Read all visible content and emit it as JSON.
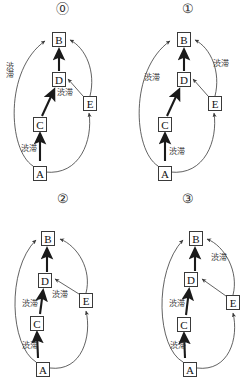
{
  "figure": {
    "kind": "causal-graph-grid",
    "rows": 2,
    "cols": 2,
    "node_labels": [
      "A",
      "B",
      "C",
      "D",
      "E"
    ],
    "edge_label_text": "渋滞",
    "stroke_color": "#3a3a3a",
    "bold_stroke_color": "#1a1a1a",
    "background": "#ffffff"
  },
  "panels": [
    {
      "id": "panel-0",
      "number": "⓪",
      "nodes": [
        {
          "name": "B",
          "label": "B",
          "x": 52,
          "y": 32
        },
        {
          "name": "D",
          "label": "D",
          "x": 52,
          "y": 72
        },
        {
          "name": "E",
          "label": "E",
          "x": 83,
          "y": 96
        },
        {
          "name": "C",
          "label": "C",
          "x": 33,
          "y": 117
        },
        {
          "name": "A",
          "label": "A",
          "x": 33,
          "y": 166
        }
      ],
      "edges": [
        {
          "from": "A",
          "to": "B",
          "style": "arc-left",
          "weight": "thin"
        },
        {
          "from": "A",
          "to": "C",
          "style": "straight",
          "weight": "bold"
        },
        {
          "from": "A",
          "to": "E",
          "style": "arc-right",
          "weight": "thin"
        },
        {
          "from": "C",
          "to": "D",
          "style": "straight",
          "weight": "bold"
        },
        {
          "from": "D",
          "to": "B",
          "style": "straight",
          "weight": "bold"
        },
        {
          "from": "E",
          "to": "D",
          "style": "straight",
          "weight": "thin"
        },
        {
          "from": "E",
          "to": "B",
          "style": "arc-right",
          "weight": "thin"
        }
      ],
      "labels": [
        {
          "name": "label-ab",
          "text": "渋滞",
          "x": 4,
          "y": 66,
          "orient": "vertical"
        },
        {
          "name": "label-ed",
          "text": "渋滞",
          "x": 57,
          "y": 89,
          "orient": "horizontal"
        },
        {
          "name": "label-ac",
          "text": "渋滞",
          "x": 21,
          "y": 143,
          "orient": "horizontal"
        }
      ]
    },
    {
      "id": "panel-1",
      "number": "①",
      "nodes": [
        {
          "name": "B",
          "label": "B",
          "x": 52,
          "y": 32
        },
        {
          "name": "D",
          "label": "D",
          "x": 52,
          "y": 72
        },
        {
          "name": "E",
          "label": "E",
          "x": 83,
          "y": 96
        },
        {
          "name": "C",
          "label": "C",
          "x": 33,
          "y": 117
        },
        {
          "name": "A",
          "label": "A",
          "x": 33,
          "y": 166
        }
      ],
      "edges": [
        {
          "from": "A",
          "to": "B",
          "style": "arc-left",
          "weight": "thin"
        },
        {
          "from": "A",
          "to": "C",
          "style": "straight",
          "weight": "bold"
        },
        {
          "from": "A",
          "to": "E",
          "style": "arc-right",
          "weight": "thin"
        },
        {
          "from": "C",
          "to": "D",
          "style": "straight",
          "weight": "bold"
        },
        {
          "from": "D",
          "to": "B",
          "style": "straight",
          "weight": "bold"
        },
        {
          "from": "E",
          "to": "D",
          "style": "straight",
          "weight": "thin"
        },
        {
          "from": "E",
          "to": "B",
          "style": "arc-right",
          "weight": "thin"
        }
      ],
      "labels": [
        {
          "name": "label-eb",
          "text": "渋滞",
          "x": 88,
          "y": 60,
          "orient": "horizontal"
        },
        {
          "name": "label-ab",
          "text": "渋滞",
          "x": 22,
          "y": 74,
          "orient": "horizontal"
        },
        {
          "name": "label-ac",
          "text": "渋滞",
          "x": 48,
          "y": 148,
          "orient": "horizontal"
        }
      ]
    },
    {
      "id": "panel-2",
      "number": "②",
      "nodes": [
        {
          "name": "B",
          "label": "B",
          "x": 41,
          "y": 41
        },
        {
          "name": "D",
          "label": "D",
          "x": 38,
          "y": 83
        },
        {
          "name": "E",
          "label": "E",
          "x": 79,
          "y": 103
        },
        {
          "name": "C",
          "label": "C",
          "x": 30,
          "y": 126
        },
        {
          "name": "A",
          "label": "A",
          "x": 36,
          "y": 172
        }
      ],
      "edges": [
        {
          "from": "A",
          "to": "B",
          "style": "arc-left",
          "weight": "thin"
        },
        {
          "from": "A",
          "to": "C",
          "style": "straight",
          "weight": "bold"
        },
        {
          "from": "A",
          "to": "E",
          "style": "arc-right",
          "weight": "thin"
        },
        {
          "from": "C",
          "to": "D",
          "style": "straight",
          "weight": "bold"
        },
        {
          "from": "D",
          "to": "B",
          "style": "straight",
          "weight": "bold"
        },
        {
          "from": "E",
          "to": "D",
          "style": "straight",
          "weight": "thin"
        },
        {
          "from": "E",
          "to": "B",
          "style": "arc-right",
          "weight": "thin"
        }
      ],
      "labels": [
        {
          "name": "label-ed",
          "text": "渋滞",
          "x": 52,
          "y": 101,
          "orient": "horizontal"
        },
        {
          "name": "label-cd",
          "text": "渋滞",
          "x": 23,
          "y": 108,
          "orient": "horizontal"
        },
        {
          "name": "label-ac",
          "text": "渋滞",
          "x": 22,
          "y": 150,
          "orient": "horizontal"
        }
      ]
    },
    {
      "id": "panel-3",
      "number": "③",
      "nodes": [
        {
          "name": "B",
          "label": "B",
          "x": 64,
          "y": 41
        },
        {
          "name": "D",
          "label": "D",
          "x": 59,
          "y": 82
        },
        {
          "name": "E",
          "label": "E",
          "x": 101,
          "y": 105
        },
        {
          "name": "C",
          "label": "C",
          "x": 52,
          "y": 127
        },
        {
          "name": "A",
          "label": "A",
          "x": 58,
          "y": 172
        }
      ],
      "edges": [
        {
          "from": "A",
          "to": "B",
          "style": "arc-left",
          "weight": "thin"
        },
        {
          "from": "A",
          "to": "C",
          "style": "straight",
          "weight": "bold"
        },
        {
          "from": "A",
          "to": "E",
          "style": "arc-right",
          "weight": "thin"
        },
        {
          "from": "C",
          "to": "D",
          "style": "straight",
          "weight": "bold"
        },
        {
          "from": "D",
          "to": "B",
          "style": "straight",
          "weight": "bold"
        },
        {
          "from": "E",
          "to": "D",
          "style": "straight",
          "weight": "thin"
        },
        {
          "from": "E",
          "to": "B",
          "style": "arc-right",
          "weight": "thin"
        }
      ],
      "labels": [
        {
          "name": "label-eb",
          "text": "渋滞",
          "x": 88,
          "y": 64,
          "orient": "horizontal"
        },
        {
          "name": "label-cd",
          "text": "渋滞",
          "x": 45,
          "y": 108,
          "orient": "horizontal"
        },
        {
          "name": "label-ac",
          "text": "渋滞",
          "x": 46,
          "y": 152,
          "orient": "horizontal"
        }
      ]
    }
  ]
}
